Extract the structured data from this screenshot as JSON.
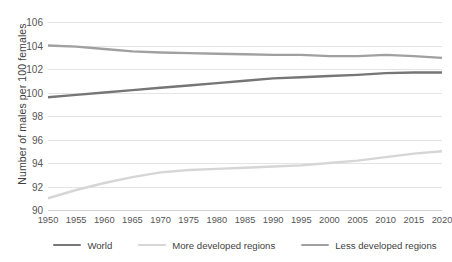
{
  "chart_data": {
    "type": "line",
    "title": "",
    "xlabel": "",
    "ylabel": "Number of males per 100 females",
    "xlim": [
      1950,
      2020
    ],
    "ylim": [
      90,
      106
    ],
    "grid": true,
    "legend_position": "bottom",
    "x": [
      1950,
      1955,
      1960,
      1965,
      1970,
      1975,
      1980,
      1985,
      1990,
      1995,
      2000,
      2005,
      2010,
      2015,
      2020
    ],
    "x_tick_labels": [
      "1950",
      "1955",
      "1960",
      "1965",
      "1970",
      "1975",
      "1980",
      "1985",
      "1990",
      "1995",
      "2000",
      "2005",
      "2010",
      "2015",
      "2020"
    ],
    "y_ticks": [
      90,
      92,
      94,
      96,
      98,
      100,
      102,
      104,
      106
    ],
    "y_tick_labels": [
      "90",
      "92",
      "94",
      "96",
      "98",
      "100",
      "102",
      "104",
      "106"
    ],
    "series": [
      {
        "name": "World",
        "color": "#767676",
        "values": [
          99.6,
          99.8,
          100.0,
          100.2,
          100.4,
          100.6,
          100.8,
          101.0,
          101.2,
          101.3,
          101.4,
          101.5,
          101.65,
          101.7,
          101.7
        ]
      },
      {
        "name": "More developed regions",
        "color": "#d6d6d6",
        "values": [
          91.0,
          91.7,
          92.3,
          92.8,
          93.2,
          93.4,
          93.5,
          93.6,
          93.7,
          93.8,
          94.0,
          94.2,
          94.5,
          94.8,
          95.0
        ]
      },
      {
        "name": "Less developed regions",
        "color": "#a0a0a0",
        "values": [
          104.0,
          103.9,
          103.7,
          103.5,
          103.4,
          103.35,
          103.3,
          103.25,
          103.2,
          103.2,
          103.1,
          103.1,
          103.2,
          103.1,
          102.95
        ]
      }
    ]
  },
  "axis": {
    "y_title": "Number of males per 100 females"
  },
  "legend": {
    "items": [
      {
        "label": "World",
        "color": "#767676"
      },
      {
        "label": "More developed regions",
        "color": "#d6d6d6"
      },
      {
        "label": "Less developed regions",
        "color": "#a0a0a0"
      }
    ]
  }
}
